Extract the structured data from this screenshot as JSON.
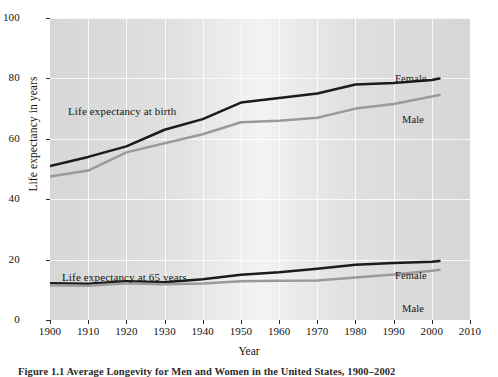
{
  "figure": {
    "caption": "Figure 1.1   Average Longevity for Men and Women in the United States, 1900–2002",
    "x_axis_title": "Year",
    "y_axis_title": "Life expectancy in years"
  },
  "annotations": {
    "group_birth": "Life expectancy at birth",
    "group_65": "Life expectancy at 65 years",
    "birth_female": "Female",
    "birth_male": "Male",
    "age65_female": "Female",
    "age65_male": "Male"
  },
  "colors": {
    "female_line": "#1b1b1b",
    "male_line": "#9a9a9a",
    "plot_background": "#e2e2e2",
    "gridline": "#ffffff",
    "text": "#131313"
  },
  "chart_data": {
    "type": "line",
    "title": "Average Longevity for Men and Women in the United States, 1900–2002",
    "xlabel": "Year",
    "ylabel": "Life expectancy in years",
    "xlim": [
      1900,
      2010
    ],
    "ylim": [
      0,
      100
    ],
    "xticks": [
      1900,
      1910,
      1920,
      1930,
      1940,
      1950,
      1960,
      1970,
      1980,
      1990,
      2000,
      2010
    ],
    "yticks": [
      0,
      20,
      40,
      60,
      80,
      100
    ],
    "grid": true,
    "legend": "inline-annotations",
    "series": [
      {
        "name": "Female",
        "group": "Life expectancy at birth",
        "color": "#1b1b1b",
        "x": [
          1900,
          1910,
          1920,
          1930,
          1940,
          1950,
          1960,
          1970,
          1980,
          1990,
          2000,
          2002
        ],
        "values": [
          51.0,
          54.0,
          57.5,
          63.0,
          66.5,
          72.0,
          73.5,
          75.0,
          78.0,
          78.5,
          79.5,
          80.0
        ]
      },
      {
        "name": "Male",
        "group": "Life expectancy at birth",
        "color": "#9a9a9a",
        "x": [
          1900,
          1910,
          1920,
          1930,
          1940,
          1950,
          1960,
          1970,
          1980,
          1990,
          2000,
          2002
        ],
        "values": [
          47.5,
          49.5,
          55.5,
          58.5,
          61.5,
          65.5,
          66.0,
          67.0,
          70.0,
          71.5,
          74.0,
          74.5
        ]
      },
      {
        "name": "Female",
        "group": "Life expectancy at 65 years",
        "color": "#1b1b1b",
        "x": [
          1900,
          1910,
          1920,
          1930,
          1940,
          1950,
          1960,
          1970,
          1980,
          1990,
          2000,
          2002
        ],
        "values": [
          12.2,
          12.0,
          12.8,
          12.5,
          13.5,
          15.0,
          15.8,
          17.0,
          18.3,
          18.9,
          19.3,
          19.5
        ]
      },
      {
        "name": "Male",
        "group": "Life expectancy at 65 years",
        "color": "#9a9a9a",
        "x": [
          1900,
          1910,
          1920,
          1930,
          1940,
          1950,
          1960,
          1970,
          1980,
          1990,
          2000,
          2002
        ],
        "values": [
          11.5,
          11.3,
          12.2,
          11.8,
          12.1,
          12.8,
          13.0,
          13.1,
          14.1,
          15.1,
          16.3,
          16.6
        ]
      }
    ]
  }
}
